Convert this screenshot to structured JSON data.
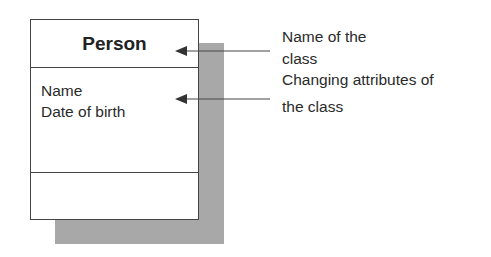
{
  "diagram": {
    "type": "uml-class",
    "class_box": {
      "name": "Person",
      "attributes": [
        "Name",
        "Date of birth"
      ],
      "operations": []
    },
    "annotations": [
      {
        "text_line1": "Name of the",
        "text_line2": "class",
        "points_to": "class name"
      },
      {
        "text_line1": "Changing attributes of",
        "text_line2": "the class",
        "points_to": "attributes"
      }
    ],
    "colors": {
      "line": "#444444",
      "shadow": "#a8a8a8",
      "text": "#2a2a2a"
    }
  }
}
